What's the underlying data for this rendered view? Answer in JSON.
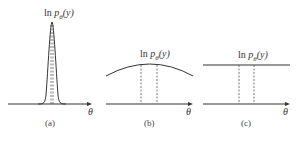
{
  "panels": [
    {
      "id": "a",
      "caption": "(a)",
      "curve_label": "ln p_θ(y)",
      "xlabel": "θ",
      "shape": "sharp peak"
    },
    {
      "id": "b",
      "caption": "(b)",
      "curve_label": "ln p_θ(y)",
      "xlabel": "θ",
      "shape": "broad arc"
    },
    {
      "id": "c",
      "caption": "(c)",
      "curve_label": "ln p_θ(y)",
      "xlabel": "θ",
      "shape": "flat line"
    }
  ],
  "labels": {
    "ln": "ln ",
    "p": "p",
    "sub": "θ",
    "arg": "(y)",
    "theta": "θ"
  },
  "colors": {
    "line": "#333333",
    "dash": "#555555"
  }
}
